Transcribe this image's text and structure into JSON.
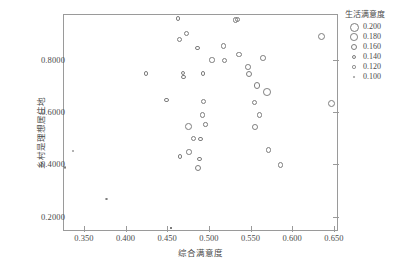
{
  "chart_data": {
    "type": "scatter",
    "title": "",
    "xlabel": "综合满意度",
    "ylabel": "乡村是理想居住地",
    "xlim": [
      0.325,
      0.655
    ],
    "ylim": [
      0.145,
      0.975
    ],
    "grid": false,
    "xticks": [
      "0.350",
      "0.400",
      "0.450",
      "0.500",
      "0.550",
      "0.600",
      "0.650"
    ],
    "xtick_values": [
      0.35,
      0.4,
      0.45,
      0.5,
      0.55,
      0.6,
      0.65
    ],
    "yticks": [
      "0.8000",
      "0.6000",
      "0.4000",
      "0.2000"
    ],
    "ytick_values": [
      0.8,
      0.6,
      0.4,
      0.2
    ],
    "size_legend": {
      "title": "生活满意度",
      "position": "right",
      "entries": [
        {
          "label": "0.200",
          "value": 0.2,
          "px": 9.0
        },
        {
          "label": "0.180",
          "value": 0.18,
          "px": 7.6
        },
        {
          "label": "0.160",
          "value": 0.16,
          "px": 6.2
        },
        {
          "label": "0.140",
          "value": 0.14,
          "px": 4.8
        },
        {
          "label": "0.120",
          "value": 0.12,
          "px": 3.4
        },
        {
          "label": "0.100",
          "value": 0.1,
          "px": 2.0
        }
      ]
    },
    "marker": {
      "shape": "circle",
      "fill": "none",
      "edge": "#7d7d7d"
    },
    "points": [
      {
        "x": 0.3275,
        "y": 0.388,
        "s": 0.108
      },
      {
        "x": 0.337,
        "y": 0.451,
        "s": 0.112
      },
      {
        "x": 0.377,
        "y": 0.268,
        "s": 0.106
      },
      {
        "x": 0.4245,
        "y": 0.748,
        "s": 0.14
      },
      {
        "x": 0.449,
        "y": 0.647,
        "s": 0.135
      },
      {
        "x": 0.4545,
        "y": 0.156,
        "s": 0.105
      },
      {
        "x": 0.463,
        "y": 0.958,
        "s": 0.14
      },
      {
        "x": 0.4645,
        "y": 0.878,
        "s": 0.146
      },
      {
        "x": 0.469,
        "y": 0.748,
        "s": 0.13
      },
      {
        "x": 0.4695,
        "y": 0.735,
        "s": 0.133
      },
      {
        "x": 0.473,
        "y": 0.9,
        "s": 0.148
      },
      {
        "x": 0.4655,
        "y": 0.43,
        "s": 0.14
      },
      {
        "x": 0.4755,
        "y": 0.546,
        "s": 0.168
      },
      {
        "x": 0.476,
        "y": 0.447,
        "s": 0.15
      },
      {
        "x": 0.4815,
        "y": 0.499,
        "s": 0.146
      },
      {
        "x": 0.486,
        "y": 0.845,
        "s": 0.142
      },
      {
        "x": 0.4875,
        "y": 0.387,
        "s": 0.158
      },
      {
        "x": 0.4885,
        "y": 0.421,
        "s": 0.136
      },
      {
        "x": 0.49,
        "y": 0.498,
        "s": 0.13
      },
      {
        "x": 0.493,
        "y": 0.747,
        "s": 0.138
      },
      {
        "x": 0.4925,
        "y": 0.589,
        "s": 0.15
      },
      {
        "x": 0.4935,
        "y": 0.641,
        "s": 0.142
      },
      {
        "x": 0.496,
        "y": 0.552,
        "s": 0.134
      },
      {
        "x": 0.504,
        "y": 0.7985,
        "s": 0.148
      },
      {
        "x": 0.5175,
        "y": 0.853,
        "s": 0.15
      },
      {
        "x": 0.5185,
        "y": 0.798,
        "s": 0.15
      },
      {
        "x": 0.532,
        "y": 0.953,
        "s": 0.152
      },
      {
        "x": 0.5345,
        "y": 0.954,
        "s": 0.154
      },
      {
        "x": 0.5365,
        "y": 0.82,
        "s": 0.152
      },
      {
        "x": 0.547,
        "y": 0.772,
        "s": 0.152
      },
      {
        "x": 0.548,
        "y": 0.746,
        "s": 0.16
      },
      {
        "x": 0.555,
        "y": 0.636,
        "s": 0.15
      },
      {
        "x": 0.5555,
        "y": 0.542,
        "s": 0.154
      },
      {
        "x": 0.5575,
        "y": 0.702,
        "s": 0.164
      },
      {
        "x": 0.561,
        "y": 0.588,
        "s": 0.15
      },
      {
        "x": 0.565,
        "y": 0.806,
        "s": 0.152
      },
      {
        "x": 0.5695,
        "y": 0.677,
        "s": 0.182
      },
      {
        "x": 0.5715,
        "y": 0.454,
        "s": 0.15
      },
      {
        "x": 0.586,
        "y": 0.398,
        "s": 0.15
      },
      {
        "x": 0.635,
        "y": 0.889,
        "s": 0.178
      },
      {
        "x": 0.6475,
        "y": 0.631,
        "s": 0.17
      }
    ]
  }
}
